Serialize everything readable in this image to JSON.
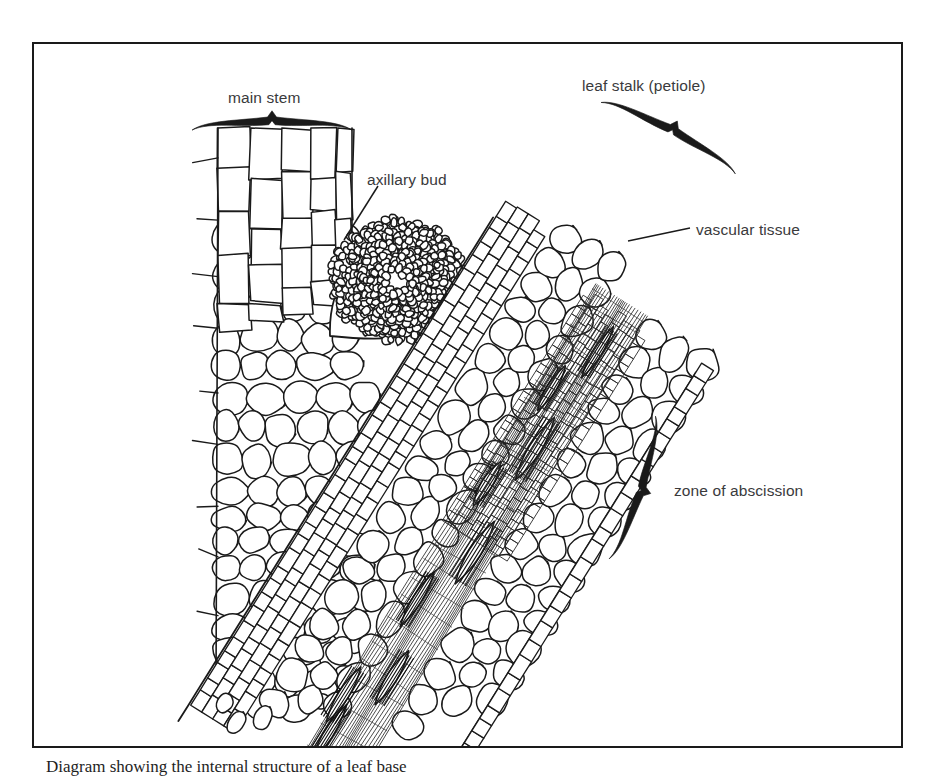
{
  "figure": {
    "kind": "botanical-micrograph-diagram",
    "background_color": "#ffffff",
    "ink_color": "#1a1a1a",
    "label_color": "#3a3a3c",
    "frame": {
      "x": 32,
      "y": 42,
      "width": 871,
      "height": 706,
      "border_width": 2
    }
  },
  "caption": {
    "text": "Diagram showing the internal structure of a leaf base"
  },
  "labels": [
    {
      "id": "main-stem",
      "text": "main stem",
      "x": 228,
      "y": 90,
      "align": "left"
    },
    {
      "id": "axillary-bud",
      "text": "axillary bud",
      "x": 367,
      "y": 172,
      "align": "left"
    },
    {
      "id": "leaf-stalk",
      "text": "leaf stalk (petiole)",
      "x": 582,
      "y": 78,
      "align": "left"
    },
    {
      "id": "vascular-tissue",
      "text": "vascular tissue",
      "x": 696,
      "y": 222,
      "align": "left"
    },
    {
      "id": "zone-abscission",
      "text": "zone of abscission",
      "x": 674,
      "y": 483,
      "align": "left"
    }
  ],
  "braces": [
    {
      "id": "brace-main-stem",
      "for": "main stem",
      "cx": 272,
      "cy": 122,
      "length": 160,
      "rotation": 0,
      "thickness": 9
    },
    {
      "id": "brace-leaf-stalk",
      "for": "leaf stalk (petiole)",
      "cx": 672,
      "cy": 131,
      "length": 152,
      "rotation": 28,
      "thickness": 9
    },
    {
      "id": "brace-zone-abscission",
      "for": "zone of abscission",
      "cx": 640,
      "cy": 490,
      "length": 150,
      "rotation": 108,
      "thickness": 9
    }
  ],
  "leaders": [
    {
      "id": "leader-axillary-bud",
      "from_label": "axillary bud",
      "x1": 378,
      "y1": 186,
      "x2": 344,
      "y2": 240
    },
    {
      "id": "leader-vascular-tissue",
      "from_label": "vascular tissue",
      "x1": 690,
      "y1": 228,
      "x2": 628,
      "y2": 241
    }
  ],
  "tissues": [
    {
      "id": "stem-epidermis",
      "name": "main stem epidermal file",
      "cell_style": "elongated-rectangular",
      "cell_count": 52
    },
    {
      "id": "stem-cortex",
      "name": "main stem cortex",
      "cell_style": "large-rounded-polygon",
      "cell_count": 190
    },
    {
      "id": "axillary-bud",
      "name": "axillary bud meristem",
      "cell_style": "dense-small-isodiametric",
      "cell_count": 520
    },
    {
      "id": "petiole-epidermis",
      "name": "petiole epidermal file",
      "cell_style": "elongated-rectangular",
      "cell_count": 120
    },
    {
      "id": "petiole-cortex",
      "name": "petiole cortex",
      "cell_style": "large-rounded-polygon",
      "cell_count": 210
    },
    {
      "id": "vascular-strands",
      "name": "vascular bundle strands",
      "cell_style": "long-fibrous-spindle",
      "cell_count": 14
    },
    {
      "id": "abscission-layer",
      "name": "abscission layer",
      "cell_style": "small-brick-rows",
      "cell_count": 160
    }
  ]
}
